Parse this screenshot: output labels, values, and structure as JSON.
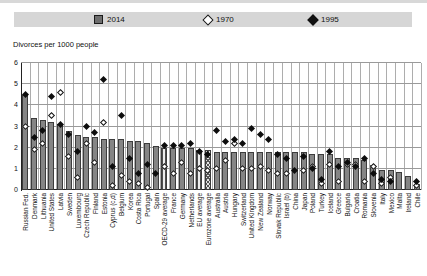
{
  "subtitle": "Divorces per 1000 people",
  "legend": {
    "items": [
      {
        "label": "2014",
        "marker": "gray-square"
      },
      {
        "label": "1970",
        "marker": "white-diamond"
      },
      {
        "label": "1995",
        "marker": "black-diamond"
      }
    ]
  },
  "colors": {
    "bar_fill": "#858585",
    "bar_border": "#3c3c3c",
    "legend_band": "#d6d6d6",
    "grid": "#9a9a9a",
    "marker_1995": "#0d0d0d",
    "marker_1970": "#ffffff"
  },
  "chart_data": {
    "type": "bar",
    "title": "",
    "ylabel": "Divorces per 1000 people",
    "xlabel": "",
    "ylim": [
      0,
      6
    ],
    "yticks": [
      0,
      1,
      2,
      3,
      4,
      5,
      6
    ],
    "grid": true,
    "legend_position": "top",
    "categories": [
      "Russian Fed.",
      "Denmark",
      "Lithuania",
      "United States",
      "Latvia",
      "Sweden",
      "Luxembourg",
      "Czech Republic",
      "Finland",
      "Estonia",
      "Cyprus (c,d)",
      "Belgium",
      "Korea",
      "Costa Rica",
      "Portugal",
      "Spain",
      "OECD-29 average",
      "France",
      "Germany",
      "Netherlands",
      "EU average",
      "Eurozone average",
      "Australia",
      "Austria",
      "Hungary",
      "Switzerland",
      "United Kingdom",
      "New Zealand",
      "Norway",
      "Slovak Republic",
      "Israel (b)",
      "China",
      "Japan",
      "Poland",
      "Turkey",
      "Iceland",
      "Greece",
      "Bulgaria",
      "Croatia",
      "Romania",
      "Slovenia",
      "Italy",
      "Mexico",
      "Malta",
      "Ireland",
      "Chile"
    ],
    "series": [
      {
        "name": "2014",
        "type": "bar",
        "values": [
          4.5,
          3.4,
          3.3,
          3.2,
          3.1,
          2.8,
          2.6,
          2.5,
          2.5,
          2.4,
          2.4,
          2.4,
          2.3,
          2.3,
          2.2,
          2.1,
          2.0,
          2.0,
          2.0,
          2.0,
          1.9,
          1.9,
          1.8,
          1.8,
          1.8,
          1.8,
          1.8,
          1.8,
          1.8,
          1.8,
          1.8,
          1.8,
          1.8,
          1.7,
          1.7,
          1.7,
          1.5,
          1.5,
          1.5,
          1.4,
          1.2,
          0.95,
          0.95,
          0.85,
          0.65,
          0.3
        ]
      },
      {
        "name": "1970",
        "type": "scatter",
        "marker": "white-diamond",
        "values": [
          3.0,
          1.9,
          2.2,
          3.5,
          4.6,
          1.6,
          0.6,
          2.2,
          1.3,
          3.2,
          0.2,
          0.7,
          0.4,
          0.3,
          0.1,
          null,
          1.1,
          0.8,
          1.3,
          0.8,
          1.0,
          0.9,
          1.0,
          1.4,
          2.2,
          1.0,
          1.0,
          1.1,
          0.9,
          0.8,
          0.8,
          null,
          0.9,
          1.1,
          0.3,
          1.2,
          0.4,
          1.2,
          1.2,
          0.4,
          1.1,
          0.3,
          0.6,
          null,
          null,
          0.2
        ]
      },
      {
        "name": "1995",
        "type": "scatter",
        "marker": "black-diamond",
        "values": [
          4.5,
          2.5,
          2.8,
          4.4,
          3.1,
          2.6,
          1.8,
          3.0,
          2.7,
          5.2,
          1.1,
          3.5,
          1.5,
          0.8,
          1.2,
          0.8,
          2.1,
          2.1,
          2.1,
          2.2,
          1.8,
          1.7,
          2.8,
          2.3,
          2.4,
          2.2,
          2.9,
          2.6,
          2.4,
          1.7,
          1.5,
          0.9,
          1.6,
          1.0,
          0.5,
          1.8,
          1.1,
          1.3,
          1.1,
          1.5,
          0.8,
          0.5,
          0.4,
          null,
          null,
          0.4
        ]
      }
    ],
    "average_bar_patterns": [
      {
        "index": 16,
        "pattern": "vstripe"
      },
      {
        "index": 20,
        "pattern": "vstripe"
      },
      {
        "index": 21,
        "pattern": "crosshatch"
      }
    ]
  }
}
